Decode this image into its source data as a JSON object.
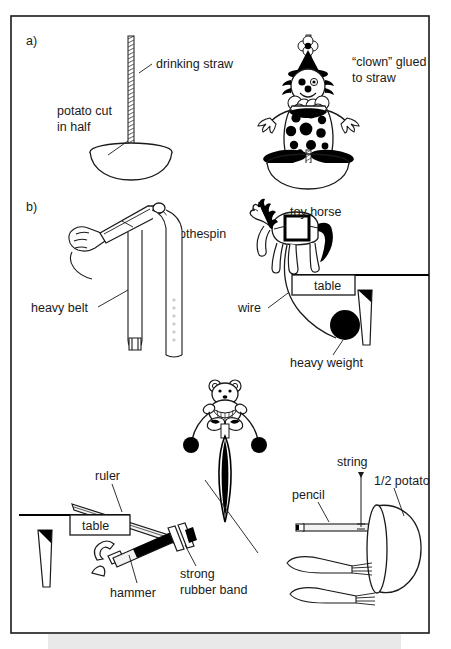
{
  "figure": {
    "frame": {
      "border_color": "#1a1a1a",
      "background": "#ffffff"
    },
    "bottom_band_color": "#e9e9e9",
    "panels": [
      {
        "id": "a",
        "letter": "a)",
        "labels": [
          {
            "name": "drinking-straw",
            "text": "drinking straw"
          },
          {
            "name": "potato-cut-in-half",
            "text": "potato cut\nin half",
            "line1": "potato cut",
            "line2": "in half"
          },
          {
            "name": "clown-glued-to-straw",
            "text": "“clown” glued to straw",
            "line1": "“clown” glued",
            "line2": "to straw"
          }
        ],
        "objects": [
          {
            "name": "drinking-straw-figure"
          },
          {
            "name": "potato-half-bowl-figure"
          },
          {
            "name": "clown-figure"
          },
          {
            "name": "clown-potato-half-bowl-figure"
          }
        ]
      },
      {
        "id": "b",
        "letter": "b)",
        "labels": [
          {
            "name": "clothespin",
            "text": "clothespin"
          },
          {
            "name": "heavy-belt",
            "text": "heavy belt"
          },
          {
            "name": "toy-horse",
            "text": "toy horse"
          },
          {
            "name": "table-horse",
            "text": "table"
          },
          {
            "name": "wire",
            "text": "wire"
          },
          {
            "name": "heavy-weight",
            "text": "heavy weight"
          },
          {
            "name": "ruler",
            "text": "ruler"
          },
          {
            "name": "table-ruler",
            "text": "table"
          },
          {
            "name": "hammer",
            "text": "hammer"
          },
          {
            "name": "strong-rubber-band",
            "text": "strong rubber band",
            "line1": "strong",
            "line2": "rubber band"
          },
          {
            "name": "pencil",
            "text": "pencil"
          },
          {
            "name": "string",
            "text": "string"
          },
          {
            "name": "half-potato",
            "text": "1/2 potato"
          }
        ],
        "objects": [
          {
            "name": "hand-figure"
          },
          {
            "name": "clothespin-figure"
          },
          {
            "name": "belt-figure"
          },
          {
            "name": "toy-horse-figure"
          },
          {
            "name": "table-edge-figure"
          },
          {
            "name": "wire-figure"
          },
          {
            "name": "heavy-weight-ball-figure"
          },
          {
            "name": "teddy-bear-figure"
          },
          {
            "name": "needle-figure"
          },
          {
            "name": "ruler-figure"
          },
          {
            "name": "hammer-figure"
          },
          {
            "name": "rubber-band-figure"
          },
          {
            "name": "pencil-figure"
          },
          {
            "name": "string-figure"
          },
          {
            "name": "potato-half-figure"
          },
          {
            "name": "forks-figure"
          }
        ]
      }
    ]
  }
}
